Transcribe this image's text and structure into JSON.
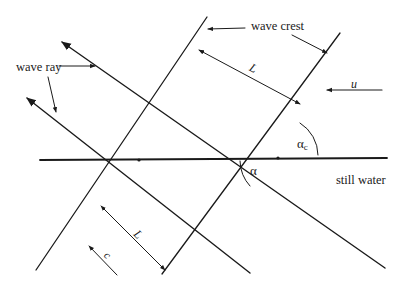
{
  "figure": {
    "labels": {
      "wave_crest": "wave crest",
      "wave_ray": "wave ray",
      "still_water": "still water",
      "current": "u",
      "wavelength_upper": "L",
      "wavelength_lower": "L",
      "celerity": "c",
      "angle_alpha": "α",
      "angle_alpha_c_base": "α",
      "angle_alpha_c_sub": "c"
    },
    "colors": {
      "ink": "#1a1a1a",
      "background": "#ffffff"
    }
  }
}
